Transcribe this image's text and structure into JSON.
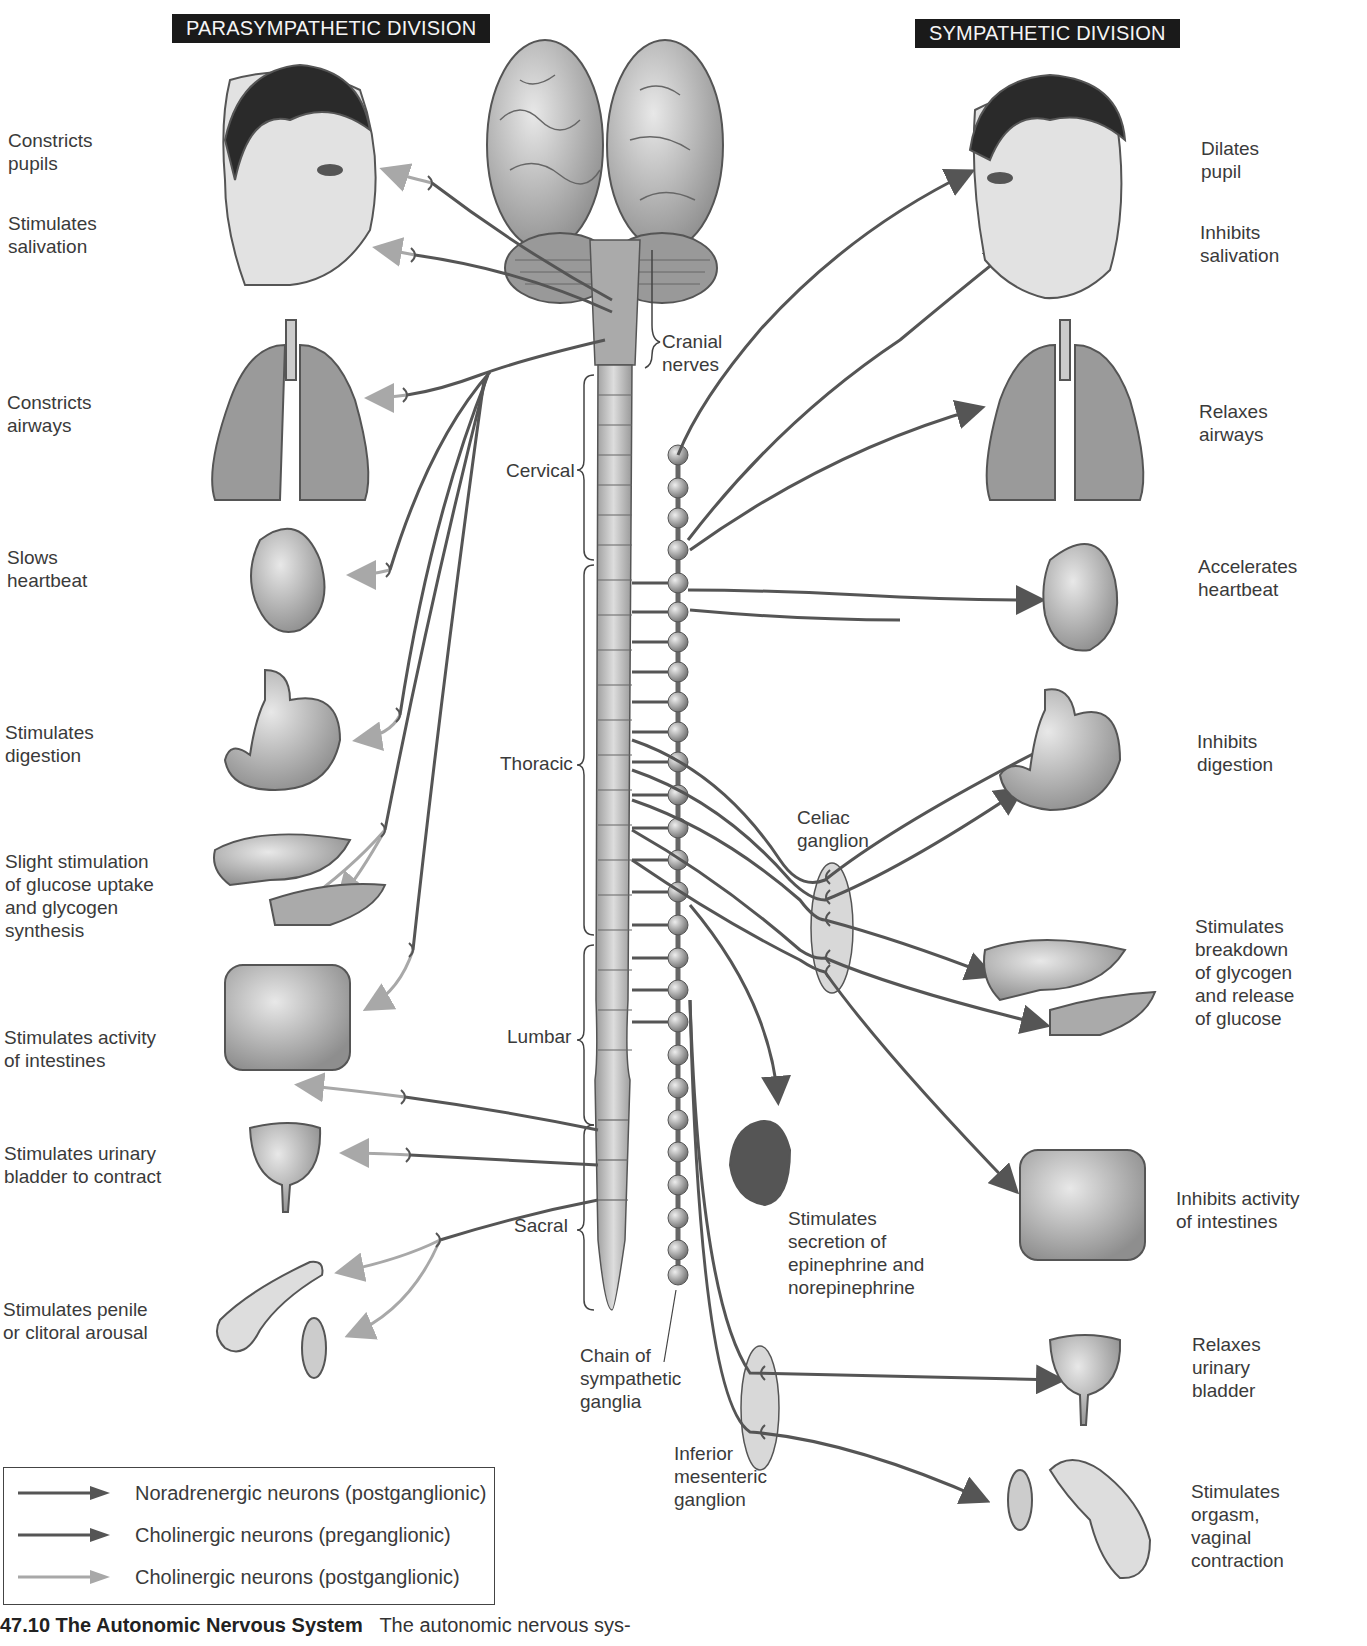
{
  "headers": {
    "parasympathetic": "PARASYMPATHETIC DIVISION",
    "sympathetic": "SYMPATHETIC DIVISION"
  },
  "parasympathetic_effects": [
    {
      "organ": "eye",
      "label": "Constricts\npupils"
    },
    {
      "organ": "salivary-glands",
      "label": "Stimulates\nsalivation"
    },
    {
      "organ": "lungs",
      "label": "Constricts\nairways"
    },
    {
      "organ": "heart",
      "label": "Slows\nheartbeat"
    },
    {
      "organ": "stomach",
      "label": "Stimulates\ndigestion"
    },
    {
      "organ": "liver-pancreas",
      "label": "Slight stimulation\nof glucose uptake\nand glycogen\nsynthesis"
    },
    {
      "organ": "intestines",
      "label": "Stimulates activity\nof intestines"
    },
    {
      "organ": "bladder",
      "label": "Stimulates urinary\nbladder to contract"
    },
    {
      "organ": "genitals",
      "label": "Stimulates penile\nor clitoral arousal"
    }
  ],
  "sympathetic_effects": [
    {
      "organ": "eye",
      "label": "Dilates\npupil"
    },
    {
      "organ": "salivary-glands",
      "label": "Inhibits\nsalivation"
    },
    {
      "organ": "lungs",
      "label": "Relaxes\nairways"
    },
    {
      "organ": "heart",
      "label": "Accelerates\nheartbeat"
    },
    {
      "organ": "stomach",
      "label": "Inhibits\ndigestion"
    },
    {
      "organ": "liver-pancreas",
      "label": "Stimulates\nbreakdown\nof glycogen\nand release\nof glucose"
    },
    {
      "organ": "adrenal-gland",
      "label": "Stimulates\nsecretion of\nepinephrine and\nnorepinephrine"
    },
    {
      "organ": "intestines",
      "label": "Inhibits activity\nof intestines"
    },
    {
      "organ": "bladder",
      "label": "Relaxes\nurinary\nbladder"
    },
    {
      "organ": "genitals",
      "label": "Stimulates\norgasm,\nvaginal\ncontraction"
    }
  ],
  "anatomy_labels": {
    "cranial_nerves": "Cranial\nnerves",
    "cervical": "Cervical",
    "thoracic": "Thoracic",
    "lumbar": "Lumbar",
    "sacral": "Sacral",
    "celiac_ganglion": "Celiac\nganglion",
    "chain_ganglia": "Chain of\nsympathetic\nganglia",
    "inferior_mesenteric": "Inferior\nmesenteric\nganglion"
  },
  "legend": [
    {
      "label": "Noradrenergic neurons (postganglionic)",
      "color": "#555555"
    },
    {
      "label": "Cholinergic neurons (preganglionic)",
      "color": "#555555"
    },
    {
      "label": "Cholinergic neurons (postganglionic)",
      "color": "#a8a8a8"
    }
  ],
  "caption": {
    "number_title": "47.10  The Autonomic Nervous System",
    "text": "The autonomic nervous sys-"
  },
  "colors": {
    "neuron_dark": "#555555",
    "neuron_light": "#a8a8a8",
    "organ_fill": "#b8b8b8",
    "ganglion_fill": "#d8d8d8",
    "header_bg": "#1a1a1a"
  }
}
